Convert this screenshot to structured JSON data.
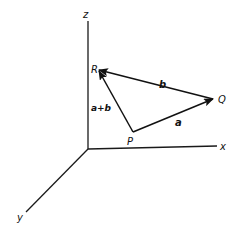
{
  "diagram": {
    "type": "3d-vector-addition",
    "colors": {
      "ink": "#111111",
      "background": "#ffffff"
    },
    "axes": [
      {
        "id": "z",
        "label": "z"
      },
      {
        "id": "x",
        "label": "x"
      },
      {
        "id": "y",
        "label": "y"
      }
    ],
    "points": [
      {
        "id": "P",
        "label": "P"
      },
      {
        "id": "Q",
        "label": "Q"
      },
      {
        "id": "R",
        "label": "R"
      }
    ],
    "vectors": [
      {
        "id": "a",
        "label": "a",
        "from": "P",
        "to": "Q"
      },
      {
        "id": "b",
        "label": "b",
        "from": "Q",
        "to": "R"
      },
      {
        "id": "a_plus_b",
        "label": "a+b",
        "from": "P",
        "to": "R"
      }
    ]
  }
}
